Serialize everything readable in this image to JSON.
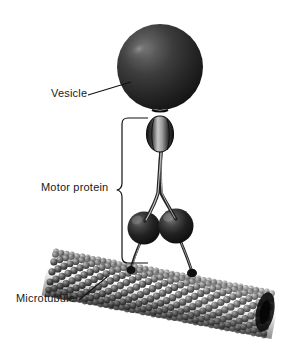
{
  "figure": {
    "kind": "scientific-illustration",
    "background_color": "#ffffff",
    "style": "grayscale airbrushed rendering",
    "width": 291,
    "height": 347
  },
  "labels": {
    "vesicle": "Vesicle",
    "motor_protein": "Motor protein",
    "microtubule": "Microtubule"
  },
  "label_colors": {
    "text": "#191919",
    "leader_line": "#111111",
    "brace": "#111111"
  },
  "structures": {
    "vesicle": {
      "name": "Vesicle",
      "shape": "sphere",
      "center_x": 160,
      "center_y": 67,
      "radius": 43,
      "fill_dark": "#1c1c1c",
      "fill_mid": "#3a3a3a",
      "highlight": "#8f8f8f",
      "highlight_x": 138,
      "highlight_y": 48
    },
    "cargo_domain": {
      "name": "Cargo binding domain",
      "shape": "ellipsoid",
      "center_x": 160,
      "center_y": 134,
      "rx": 13,
      "ry": 18,
      "fill_dark": "#2a2a2a",
      "highlight": "#cfcfcf"
    },
    "stalk": {
      "name": "Coiled-coil stalk",
      "top_x": 160,
      "top_y": 150,
      "split_y": 196,
      "stroke": "#2b2b2b",
      "width_px": 3
    },
    "motor_heads": [
      {
        "name": "Motor head left",
        "center_x": 144,
        "center_y": 228,
        "radius": 16,
        "fill_dark": "#141414",
        "highlight": "#6d6d6d"
      },
      {
        "name": "Motor head right",
        "center_x": 175,
        "center_y": 226,
        "radius": 17,
        "fill_dark": "#121212",
        "highlight": "#7a7a7a"
      }
    ],
    "legs": [
      {
        "name": "Leg left",
        "from_x": 141,
        "from_y": 243,
        "to_x": 132,
        "to_y": 268
      },
      {
        "name": "Leg right",
        "from_x": 179,
        "from_y": 241,
        "to_x": 192,
        "to_y": 272
      }
    ],
    "microtubule": {
      "name": "Microtubule",
      "shape": "cylinder of tubulin subunits",
      "left_end_x": 52,
      "left_end_y": 273,
      "right_end_x": 268,
      "right_end_y": 314,
      "radius_px": 22,
      "subunit_radius": 3.4,
      "subunit_fill_light": "#8a8a8a",
      "subunit_fill_dark": "#141414",
      "protofilament_count": 13,
      "rings_count": 42
    }
  },
  "leader_lines": [
    {
      "name": "vesicle-leader",
      "x1": 88,
      "y1": 95,
      "x2": 131,
      "y2": 82
    },
    {
      "name": "microtubule-leader",
      "x1": 79,
      "y1": 300,
      "x2": 106,
      "y2": 278
    }
  ],
  "brace": {
    "name": "motor-protein-brace",
    "top_x": 148,
    "top_y": 118,
    "bottom_x": 148,
    "bottom_y": 263,
    "spine_x": 122,
    "tip_x": 117,
    "tip_y": 190
  }
}
